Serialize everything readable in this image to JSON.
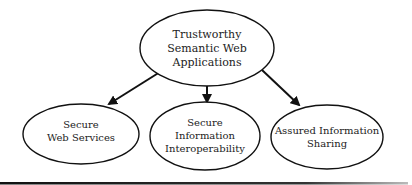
{
  "diagram": {
    "root": {
      "lines": [
        "Trustworthy",
        "Semantic Web",
        "Applications"
      ]
    },
    "children": [
      {
        "lines": [
          "Secure",
          "Web Services"
        ]
      },
      {
        "lines": [
          "Secure",
          "Information",
          "Interoperability"
        ]
      },
      {
        "lines": [
          "Assured Information",
          "Sharing"
        ]
      }
    ],
    "colors": {
      "stroke": "#111111",
      "text": "#222222",
      "background": "#ffffff"
    }
  }
}
